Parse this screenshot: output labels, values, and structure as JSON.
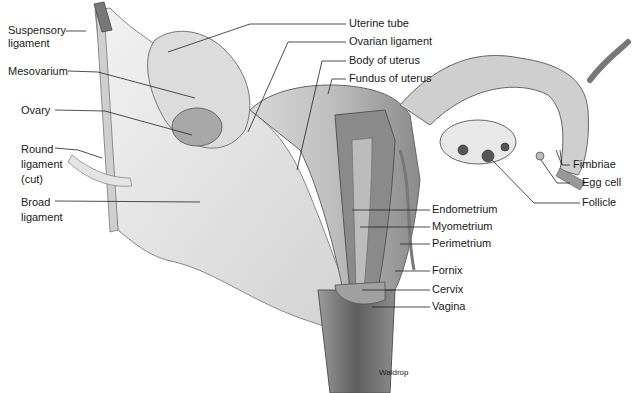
{
  "figure": {
    "credit": "Waldrop",
    "colors": {
      "background": "#ffffff",
      "tissue_light": "#e6e6e6",
      "tissue_mid": "#b8b8b8",
      "tissue_dark": "#6e6e6e",
      "leader_line": "#222222",
      "label_text": "#1a1a1a"
    }
  },
  "labels": {
    "left": [
      {
        "id": "suspensory-ligament",
        "lines": [
          "Suspensory",
          "ligament"
        ]
      },
      {
        "id": "mesovarium",
        "lines": [
          "Mesovarium"
        ]
      },
      {
        "id": "ovary",
        "lines": [
          "Ovary"
        ]
      },
      {
        "id": "round-ligament",
        "lines": [
          "Round",
          "ligament",
          "(cut)"
        ]
      },
      {
        "id": "broad-ligament",
        "lines": [
          "Broad",
          "ligament"
        ]
      }
    ],
    "top": [
      {
        "id": "uterine-tube",
        "text": "Uterine tube"
      },
      {
        "id": "ovarian-ligament",
        "text": "Ovarian ligament"
      },
      {
        "id": "body-of-uterus",
        "text": "Body of uterus"
      },
      {
        "id": "fundus-of-uterus",
        "text": "Fundus of uterus"
      }
    ],
    "right": [
      {
        "id": "fimbriae",
        "text": "Fimbriae"
      },
      {
        "id": "egg-cell",
        "text": "Egg cell"
      },
      {
        "id": "follicle",
        "text": "Follicle"
      },
      {
        "id": "endometrium",
        "text": "Endometrium"
      },
      {
        "id": "myometrium",
        "text": "Myometrium"
      },
      {
        "id": "perimetrium",
        "text": "Perimetrium"
      },
      {
        "id": "fornix",
        "text": "Fornix"
      },
      {
        "id": "cervix",
        "text": "Cervix"
      },
      {
        "id": "vagina",
        "text": "Vagina"
      }
    ]
  }
}
